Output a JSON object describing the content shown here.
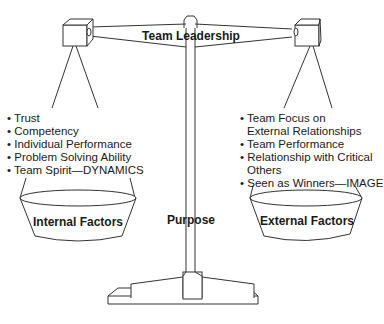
{
  "diagram": {
    "type": "balance-scale",
    "beam_label": "Team Leadership",
    "post_label": "Purpose",
    "left_pan": {
      "label": "Internal Factors",
      "items": [
        "Trust",
        "Competency",
        "Individual Performance",
        "Problem Solving Ability",
        "Team Spirit—DYNAMICS"
      ]
    },
    "right_pan": {
      "label": "External Factors",
      "items": [
        [
          "Team Focus on",
          "External Relationships"
        ],
        [
          "Team Performance"
        ],
        [
          "Relationship with Critical",
          "Others"
        ],
        [
          "Seen as Winners—IMAGE"
        ]
      ]
    },
    "bullet": "•",
    "colors": {
      "stroke": "#333333",
      "text": "#1a1a1a",
      "background": "#ffffff"
    }
  }
}
